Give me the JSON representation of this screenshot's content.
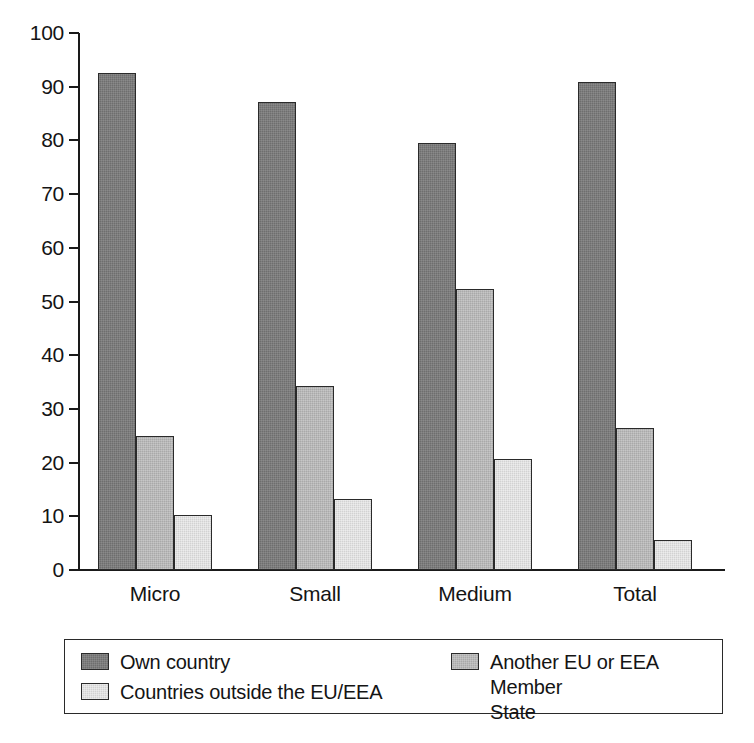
{
  "chart_data": {
    "type": "bar",
    "title": "",
    "subtitle": "",
    "xlabel": "",
    "ylabel": "",
    "ylim": [
      0,
      100
    ],
    "ytick_step": 10,
    "yticks": [
      100,
      90,
      80,
      70,
      60,
      50,
      40,
      30,
      20,
      10,
      0
    ],
    "grid": false,
    "legend_position": "bottom",
    "categories": [
      "Micro",
      "Small",
      "Medium",
      "Total"
    ],
    "series": [
      {
        "name": "Own country",
        "color": "#6e6e6e",
        "values": [
          92.5,
          87.2,
          79.5,
          90.8
        ]
      },
      {
        "name": "Another EU or EEA Member\nState",
        "color": "#a9a9a9",
        "values": [
          25.0,
          34.2,
          52.3,
          26.4
        ]
      },
      {
        "name": "Countries outside the EU/EEA",
        "color": "#d2d2d2",
        "values": [
          10.2,
          13.3,
          20.6,
          5.5
        ]
      }
    ]
  },
  "axis": {
    "y_tick_labels": [
      "100",
      "90",
      "80",
      "70",
      "60",
      "50",
      "40",
      "30",
      "20",
      "10",
      "0"
    ]
  },
  "categories": {
    "items": [
      "Micro",
      "Small",
      "Medium",
      "Total"
    ]
  },
  "legend": {
    "entries": [
      {
        "label": "Own country",
        "color": "#6e6e6e"
      },
      {
        "label": "Another EU or EEA Member\nState",
        "color": "#a9a9a9"
      },
      {
        "label": "Countries outside the EU/EEA",
        "color": "#d2d2d2"
      }
    ]
  },
  "colors": {
    "series_own_country": "#6e6e6e",
    "series_another_eu_eea": "#a9a9a9",
    "series_outside_eu_eea": "#d2d2d2",
    "axis": "#1a1a1a",
    "text": "#141414",
    "background": "#ffffff"
  }
}
